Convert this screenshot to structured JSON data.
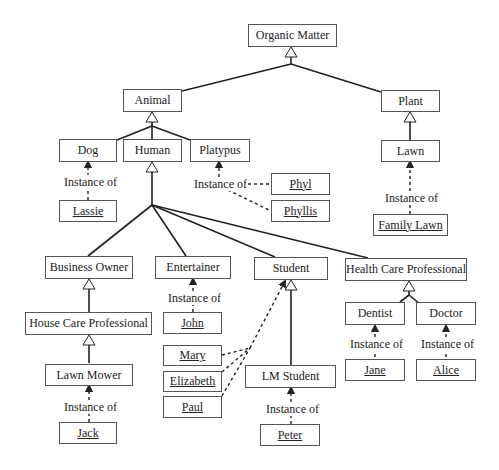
{
  "diagram": {
    "type": "UML class/instance hierarchy",
    "classes": {
      "organic_matter": "Organic Matter",
      "animal": "Animal",
      "plant": "Plant",
      "dog": "Dog",
      "human": "Human",
      "platypus": "Platypus",
      "lawn": "Lawn",
      "business_owner": "Business Owner",
      "entertainer": "Entertainer",
      "student": "Student",
      "health_care_professional": "Health Care Professional",
      "house_care_professional": "House Care Professional",
      "lawn_mower": "Lawn Mower",
      "dentist": "Dentist",
      "doctor": "Doctor",
      "lm_student": "LM Student"
    },
    "instances": {
      "lassie": "Lassie",
      "phyl": "Phyl",
      "phyllis": "Phyllis",
      "family_lawn": "Family Lawn",
      "john": "John",
      "mary": "Mary",
      "elizabeth": "Elizabeth",
      "paul": "Paul",
      "jack": "Jack",
      "peter": "Peter",
      "jane": "Jane",
      "alice": "Alice"
    },
    "relation_label": "Instance of",
    "generalizations": [
      [
        "Animal",
        "Organic Matter"
      ],
      [
        "Plant",
        "Organic Matter"
      ],
      [
        "Dog",
        "Animal"
      ],
      [
        "Human",
        "Animal"
      ],
      [
        "Platypus",
        "Animal"
      ],
      [
        "Lawn",
        "Plant"
      ],
      [
        "Business Owner",
        "Human"
      ],
      [
        "Entertainer",
        "Human"
      ],
      [
        "Student",
        "Human"
      ],
      [
        "Health Care Professional",
        "Human"
      ],
      [
        "House Care Professional",
        "Business Owner"
      ],
      [
        "Lawn Mower",
        "House Care Professional"
      ],
      [
        "LM Student",
        "Student"
      ],
      [
        "Dentist",
        "Health Care Professional"
      ],
      [
        "Doctor",
        "Health Care Professional"
      ]
    ],
    "instance_of": [
      [
        "Lassie",
        "Dog"
      ],
      [
        "Phyl",
        "Platypus"
      ],
      [
        "Phyllis",
        "Platypus"
      ],
      [
        "Family Lawn",
        "Lawn"
      ],
      [
        "John",
        "Entertainer"
      ],
      [
        "Mary",
        "Student"
      ],
      [
        "Elizabeth",
        "Student"
      ],
      [
        "Paul",
        "Student"
      ],
      [
        "Jack",
        "Lawn Mower"
      ],
      [
        "Peter",
        "LM Student"
      ],
      [
        "Jane",
        "Dentist"
      ],
      [
        "Alice",
        "Doctor"
      ]
    ]
  }
}
